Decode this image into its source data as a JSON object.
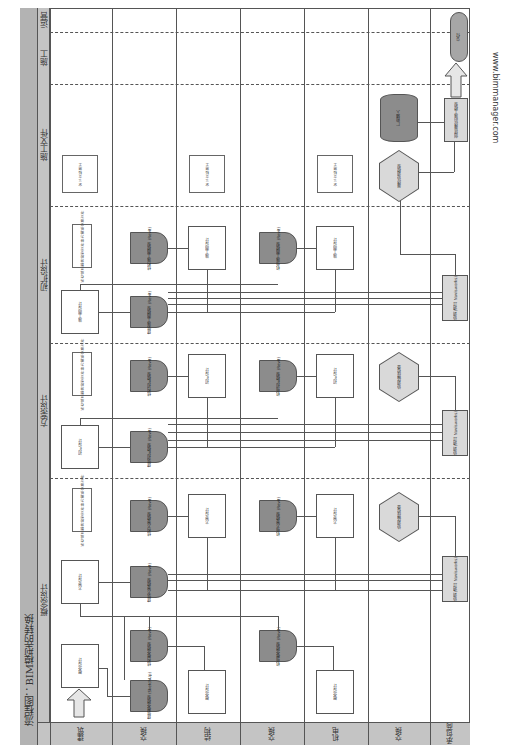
{
  "title": "流程图：BIM模型的转换",
  "watermark": "www.bimmanager.com",
  "phases": [
    {
      "id": "concept",
      "label": "概念设计"
    },
    {
      "id": "schematic",
      "label": "方案设计"
    },
    {
      "id": "design_dev",
      "label": "初扩设计"
    },
    {
      "id": "construction_docs",
      "label": "施工文件"
    },
    {
      "id": "construction",
      "label": "施工"
    },
    {
      "id": "operation",
      "label": "运营"
    }
  ],
  "lanes": [
    {
      "id": "arch",
      "label": "建筑"
    },
    {
      "id": "exchange1",
      "label": "交换"
    },
    {
      "id": "struct",
      "label": "结构"
    },
    {
      "id": "exchange2",
      "label": "交换"
    },
    {
      "id": "mep",
      "label": "机电"
    },
    {
      "id": "exchange3",
      "label": "交换"
    },
    {
      "id": "contractor",
      "label": "承包商"
    }
  ],
  "nodes": {
    "concept": {
      "arch_design": "概念设计",
      "arch_model": "建筑概念模型 (SketchUp)",
      "struct_model": "结构概念模型 (Revit)",
      "struct_design": "概念设计",
      "mep_model": "机电概念模型 (Revit)",
      "mep_design": "概念设计"
    },
    "schematic": {
      "arch_design": "方案设计",
      "note": "所有成员都将模型文件转为图纸交换文件",
      "arch_model": "建筑方案模型 (Revit)",
      "struct_model": "结构方案模型 (Revit)",
      "struct_design": "方案设计",
      "mep_model": "机电方案模型 (Revit)",
      "mep_design": "方案设计",
      "clash": "协调 (通过 Navisworks)",
      "hex": "协调碰撞检查"
    },
    "design_dev": {
      "arch_design": "初扩设计",
      "note": "所有成员都将模型文件转为图纸交换文件",
      "arch_model": "建筑初扩模型 (Revit)",
      "struct_model": "结构初扩模型 (Revit)",
      "struct_design": "初扩设计",
      "mep_model": "机电初扩模型 (Revit)",
      "mep_design": "初扩设计",
      "clash": "协调 (通过 Navisworks)",
      "hex": "协调碰撞检查"
    },
    "construction_docs": {
      "arch_design": "施工图设计",
      "note": "所有成员都将模型文件转为图纸交换文件",
      "arch_model": "建筑施工图模型 (Revit)",
      "struct_model": "结构施工图模型 (Revit)",
      "struct_design": "施工图设计",
      "mep_model": "机电施工图模型 (Revit)",
      "mep_design": "施工图设计",
      "clash": "协调 (通过 Navisworks)"
    },
    "construction": {
      "arch_note": "定义文档施工",
      "struct_note": "定义文档施工",
      "mep_note": "定义文档施工",
      "hex": "最终协调模型",
      "cyl": "厂商输入",
      "proc": "创建最终的施工模型"
    },
    "operation": {
      "terminal": "交付"
    }
  }
}
